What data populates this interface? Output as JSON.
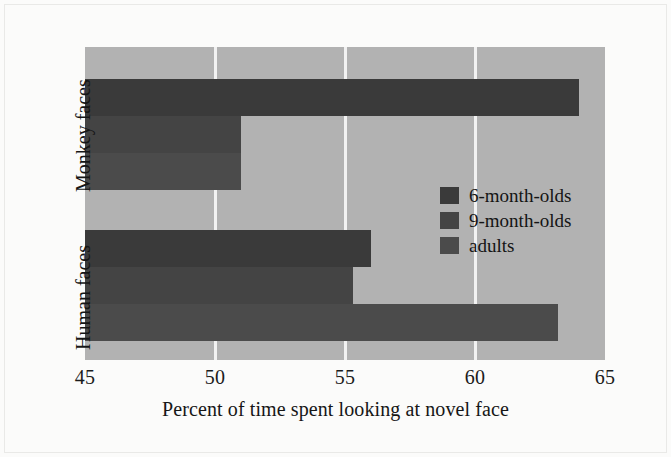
{
  "chart_data": {
    "type": "bar",
    "orientation": "horizontal",
    "title": "",
    "xlabel": "Percent of time spent looking at novel face",
    "ylabel": "",
    "categories": [
      "Monkey faces",
      "Human faces"
    ],
    "series": [
      {
        "name": "6-month-olds",
        "values": [
          64.0,
          56.0
        ],
        "color": "#3a3a3a"
      },
      {
        "name": "9-month-olds",
        "values": [
          51.0,
          55.3
        ],
        "color": "#444444"
      },
      {
        "name": "adults",
        "values": [
          51.0,
          63.2
        ],
        "color": "#4b4b4b"
      }
    ],
    "xlim": [
      45,
      65
    ],
    "xticks": [
      45,
      50,
      55,
      60,
      65
    ],
    "xtick_labels": [
      "45",
      "50",
      "55",
      "60",
      "65"
    ],
    "grid": true,
    "gridline_values": [
      50,
      55,
      60
    ],
    "gridline_color": "#f2f2f2",
    "plot_background": "#b2b2b2",
    "figure_background": "#fbfbfa",
    "legend_position": "center-right",
    "legend_entries": [
      "6-month-olds",
      "9-month-olds",
      "adults"
    ]
  },
  "axis": {
    "x_tick_45": "45",
    "x_tick_50": "50",
    "x_tick_55": "55",
    "x_tick_60": "60",
    "x_tick_65": "65",
    "x_axis_title": "Percent of time spent looking at novel face",
    "y_category_monkey": "Monkey faces",
    "y_category_human": "Human faces"
  },
  "legend": {
    "item_6mo": "6-month-olds",
    "item_9mo": "9-month-olds",
    "item_adults": "adults"
  }
}
